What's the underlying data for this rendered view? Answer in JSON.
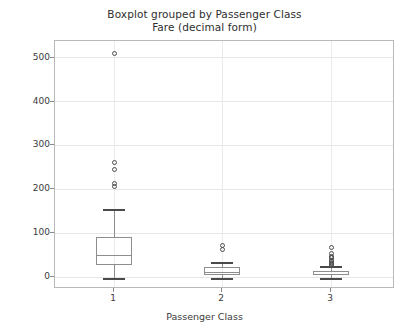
{
  "chart_data": {
    "type": "box",
    "title": "Boxplot grouped by Passenger Class",
    "subtitle": "Fare (decimal form)",
    "xlabel": "Passenger Class",
    "ylabel": "Fare (£)",
    "categories": [
      "1",
      "2",
      "3"
    ],
    "ylim": [
      -25,
      540
    ],
    "ytick_labels": [
      "0",
      "100",
      "200",
      "300",
      "400",
      "500"
    ],
    "ytick_values": [
      0,
      100,
      200,
      300,
      400,
      500
    ],
    "grid": true,
    "legend": "none",
    "boxes": [
      {
        "category": "1",
        "whisker_low": 0,
        "q1": 30,
        "median": 52,
        "q3": 93,
        "whisker_high": 157,
        "outliers": [
          208,
          216,
          247,
          263,
          512
        ]
      },
      {
        "category": "2",
        "whisker_low": 0,
        "q1": 7,
        "median": 14,
        "q3": 26,
        "whisker_high": 36,
        "outliers": [
          65,
          73
        ]
      },
      {
        "category": "3",
        "whisker_low": 0,
        "q1": 7.75,
        "median": 8.05,
        "q3": 15.5,
        "whisker_high": 27,
        "outliers": [
          29,
          31,
          34,
          35,
          39,
          41,
          46,
          47,
          49,
          56,
          69
        ]
      }
    ]
  },
  "axes": {
    "ytick_0": "0",
    "ytick_100": "100",
    "ytick_200": "200",
    "ytick_300": "300",
    "ytick_400": "400",
    "ytick_500": "500",
    "xtick_1": "1",
    "xtick_2": "2",
    "xtick_3": "3"
  }
}
